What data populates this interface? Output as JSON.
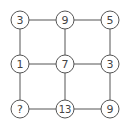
{
  "diagram": {
    "type": "number-grid-puzzle",
    "line_color": "#555555",
    "node_stroke": "#555555",
    "node_fill": "#ffffff",
    "nodes": [
      {
        "id": "r0c0",
        "label": "3"
      },
      {
        "id": "r0c1",
        "label": "9"
      },
      {
        "id": "r0c2",
        "label": "5"
      },
      {
        "id": "r1c0",
        "label": "1"
      },
      {
        "id": "r1c1",
        "label": "7"
      },
      {
        "id": "r1c2",
        "label": "3"
      },
      {
        "id": "r2c0",
        "label": "?"
      },
      {
        "id": "r2c1",
        "label": "13"
      },
      {
        "id": "r2c2",
        "label": "9"
      }
    ]
  }
}
